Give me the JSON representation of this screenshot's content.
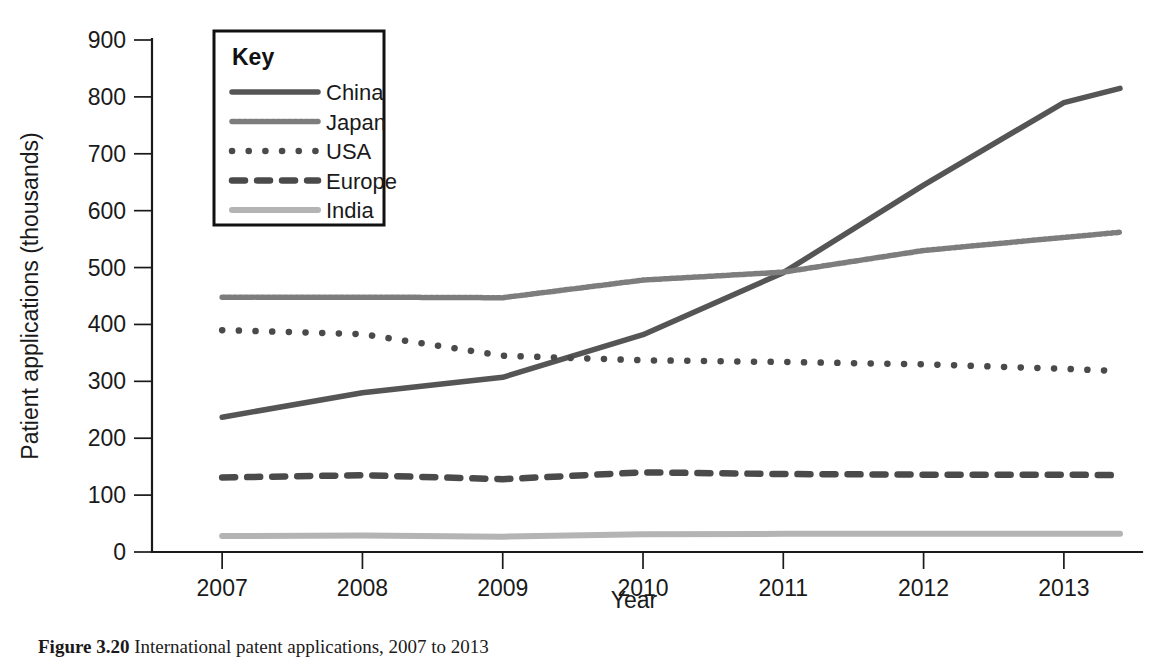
{
  "figure": {
    "caption_label": "Figure 3.20",
    "caption_text": "International patent applications, 2007 to 2013"
  },
  "chart_data": {
    "type": "line",
    "title": "",
    "xlabel": "Year",
    "ylabel": "Patient applications (thousands)",
    "x": [
      2007,
      2008,
      2009,
      2010,
      2011,
      2012,
      2013
    ],
    "categories": [
      "2007",
      "2008",
      "2009",
      "2010",
      "2011",
      "2012",
      "2013"
    ],
    "xlim": [
      2006.5,
      2013.4
    ],
    "ylim": [
      0,
      900
    ],
    "yticks": [
      0,
      100,
      200,
      300,
      400,
      500,
      600,
      700,
      800,
      900
    ],
    "ytick_labels": [
      "0",
      "100",
      "200",
      "300",
      "400",
      "500",
      "600",
      "700",
      "800",
      "900"
    ],
    "grid": false,
    "legend_position": "upper-left-inset",
    "legend_title": "Key",
    "series": [
      {
        "name": "China",
        "style": "solid",
        "color": "#555555",
        "width": 5.5,
        "values": [
          237,
          280,
          307,
          382,
          491,
          645,
          790
        ],
        "x_end": 2013.4,
        "value_end": 815
      },
      {
        "name": "Japan",
        "style": "fine-dotted",
        "color": "#7d7d7d",
        "width": 5.5,
        "values": [
          448,
          448,
          447,
          478,
          492,
          530,
          553
        ],
        "x_end": 2013.4,
        "value_end": 562
      },
      {
        "name": "USA",
        "style": "round-dotted",
        "color": "#4a4a4a",
        "width": 6.5,
        "values": [
          390,
          383,
          345,
          337,
          334,
          330,
          322
        ],
        "x_end": 2013.4,
        "value_end": 318
      },
      {
        "name": "Europe",
        "style": "dashed",
        "color": "#4a4a4a",
        "width": 6.5,
        "values": [
          131,
          135,
          128,
          140,
          137,
          136,
          136
        ],
        "x_end": 2013.4,
        "value_end": 135
      },
      {
        "name": "India",
        "style": "solid",
        "color": "#b4b4b4",
        "width": 6,
        "values": [
          28,
          29,
          27,
          31,
          32,
          32,
          32
        ],
        "x_end": 2013.4,
        "value_end": 32
      }
    ]
  }
}
